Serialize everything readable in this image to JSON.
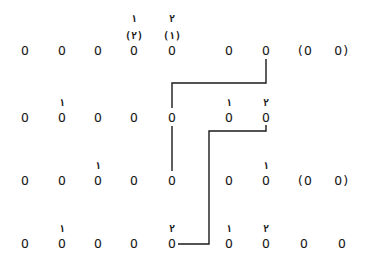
{
  "rows": [
    {
      "cells": [
        "O",
        "O",
        "O",
        "O",
        "O",
        "O",
        "O",
        "(O",
        "O)"
      ],
      "marks": [
        {
          "col": 3,
          "top": "١",
          "paren": "(٢)"
        },
        {
          "col": 4,
          "top": "٢",
          "paren": "(١)"
        }
      ]
    },
    {
      "cells": [
        "O",
        "O",
        "O",
        "O",
        "O",
        "O",
        "O"
      ],
      "marks": [
        {
          "col": 1,
          "top": "١"
        },
        {
          "col": 5,
          "top": "١"
        },
        {
          "col": 6,
          "top": "٢"
        }
      ]
    },
    {
      "cells": [
        "O",
        "O",
        "O",
        "O",
        "O",
        "O",
        "O",
        "(O",
        "O)"
      ],
      "marks": [
        {
          "col": 2,
          "top": "١"
        },
        {
          "col": 6,
          "top": "١"
        }
      ]
    },
    {
      "cells": [
        "O",
        "O",
        "O",
        "O",
        "O",
        "O",
        "O",
        "O",
        "O"
      ],
      "marks": [
        {
          "col": 1,
          "top": "١"
        },
        {
          "col": 4,
          "top": "٢"
        },
        {
          "col": 5,
          "top": "١"
        },
        {
          "col": 6,
          "top": "٢"
        }
      ]
    }
  ],
  "connectors": [
    {
      "from": {
        "row": 0,
        "col": 6
      },
      "to": {
        "row": 1,
        "col": 4
      }
    },
    {
      "from": {
        "row": 1,
        "col": 6
      },
      "to": {
        "row": 3,
        "col": 4
      }
    }
  ]
}
